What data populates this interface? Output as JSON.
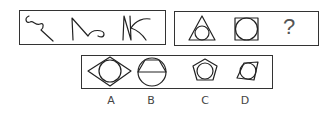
{
  "puzzle": {
    "sequence_box": {
      "figures": [
        "curly-hook-stroke",
        "zigzag-with-curl-stroke",
        "N-with-arc-stroke"
      ]
    },
    "question_box": {
      "figures": [
        "triangle-circumscribing-circle",
        "square-circumscribing-circle"
      ],
      "question_mark": "?"
    },
    "options_box": {
      "options": [
        {
          "label": "A",
          "figure": "rhombus-with-circle"
        },
        {
          "label": "B",
          "figure": "circle-with-inscribed-trapezoid"
        },
        {
          "label": "C",
          "figure": "pentagon-with-circle"
        },
        {
          "label": "D",
          "figure": "quadrilateral-with-circle"
        }
      ]
    }
  }
}
